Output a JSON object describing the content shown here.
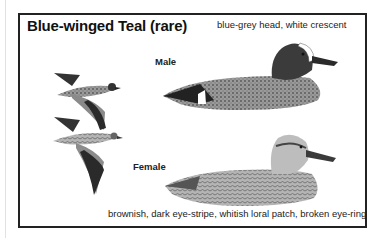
{
  "plate": {
    "title": "Blue-winged Teal (rare)",
    "male_label": "Male",
    "female_label": "Female",
    "male_caption": "blue-grey head, white crescent",
    "female_caption": "brownish, dark eye-stripe, whitish loral patch, broken eye-ring"
  },
  "illustrations": [
    {
      "name": "flying-male",
      "description": "male teal in flight"
    },
    {
      "name": "flying-female",
      "description": "female teal in flight"
    },
    {
      "name": "swimming-male",
      "description": "male teal swimming, dark head with white crescent"
    },
    {
      "name": "swimming-female",
      "description": "female teal swimming, mottled brown"
    }
  ]
}
